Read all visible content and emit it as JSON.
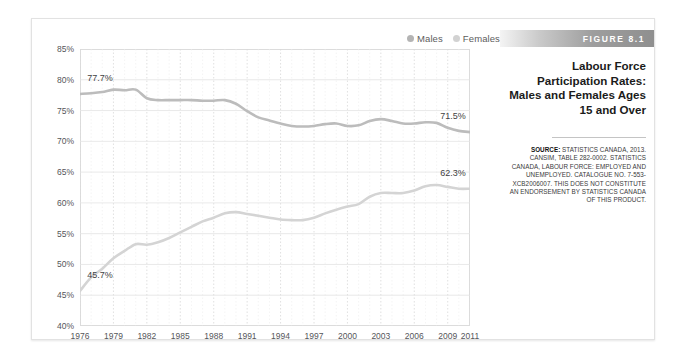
{
  "figure": {
    "banner_label": "FIGURE 8.1",
    "title_lines": [
      "Labour Force",
      "Participation Rates:",
      "Males and Females Ages",
      "15 and Over"
    ],
    "source_prefix": "SOURCE:",
    "source_text": " STATISTICS CANADA, 2013. CANSIM, TABLE 282-0002. STATISTICS CANADA, LABOUR FORCE: EMPLOYED AND UNEMPLOYED. CATALOGUE NO. 7-553-XCB2006007. THIS DOES NOT CONSTITUTE AN ENDORSEMENT BY STATISTICS CANADA OF THIS PRODUCT."
  },
  "legend": {
    "position": "top-right",
    "entries": [
      {
        "label": "Males",
        "color": "#b4b4b4"
      },
      {
        "label": "Females",
        "color": "#d2d2d2"
      }
    ]
  },
  "annotations": [
    {
      "text": "77.7%",
      "series": "Males",
      "x": 1976,
      "y": 77.7,
      "placement": "above-left"
    },
    {
      "text": "71.5%",
      "series": "Males",
      "x": 2011,
      "y": 71.5,
      "placement": "above-right"
    },
    {
      "text": "45.7%",
      "series": "Females",
      "x": 1976,
      "y": 45.7,
      "placement": "above-left"
    },
    {
      "text": "62.3%",
      "series": "Females",
      "x": 2011,
      "y": 62.3,
      "placement": "above-right"
    }
  ],
  "chart_data": {
    "type": "line",
    "xlabel": "",
    "ylabel": "",
    "xlim": [
      1976,
      2011
    ],
    "ylim": [
      40,
      85
    ],
    "ytick_step": 5,
    "ytick_labels": [
      "40%",
      "45%",
      "50%",
      "55%",
      "60%",
      "65%",
      "70%",
      "75%",
      "80%",
      "85%"
    ],
    "ytick_values": [
      40,
      45,
      50,
      55,
      60,
      65,
      70,
      75,
      80,
      85
    ],
    "xtick_labels": [
      "1976",
      "1979",
      "1982",
      "1985",
      "1988",
      "1991",
      "1994",
      "1997",
      "2000",
      "2003",
      "2006",
      "2009",
      "2011"
    ],
    "xtick_values": [
      1976,
      1979,
      1982,
      1985,
      1988,
      1991,
      1994,
      1997,
      2000,
      2003,
      2006,
      2009,
      2011
    ],
    "grid": {
      "horizontal": true,
      "vertical": true,
      "vertical_every_years": 1
    },
    "legend_position": "top-right",
    "x": [
      1976,
      1977,
      1978,
      1979,
      1980,
      1981,
      1982,
      1983,
      1984,
      1985,
      1986,
      1987,
      1988,
      1989,
      1990,
      1991,
      1992,
      1993,
      1994,
      1995,
      1996,
      1997,
      1998,
      1999,
      2000,
      2001,
      2002,
      2003,
      2004,
      2005,
      2006,
      2007,
      2008,
      2009,
      2010,
      2011
    ],
    "series": [
      {
        "name": "Males",
        "color": "#bcbcbc",
        "values": [
          77.7,
          77.8,
          78.0,
          78.4,
          78.3,
          78.4,
          77.0,
          76.7,
          76.7,
          76.7,
          76.7,
          76.6,
          76.6,
          76.7,
          76.1,
          74.9,
          73.9,
          73.4,
          72.9,
          72.5,
          72.4,
          72.5,
          72.8,
          72.9,
          72.5,
          72.6,
          73.3,
          73.6,
          73.3,
          72.9,
          72.9,
          73.1,
          73.0,
          72.2,
          71.7,
          71.5
        ]
      },
      {
        "name": "Females",
        "color": "#d4d4d4",
        "values": [
          45.7,
          47.9,
          49.3,
          51.0,
          52.2,
          53.3,
          53.2,
          53.6,
          54.3,
          55.2,
          56.1,
          57.0,
          57.6,
          58.3,
          58.5,
          58.2,
          57.9,
          57.6,
          57.3,
          57.2,
          57.2,
          57.6,
          58.3,
          58.9,
          59.4,
          59.8,
          61.0,
          61.6,
          61.6,
          61.6,
          62.0,
          62.7,
          62.9,
          62.6,
          62.3,
          62.3
        ]
      }
    ]
  }
}
